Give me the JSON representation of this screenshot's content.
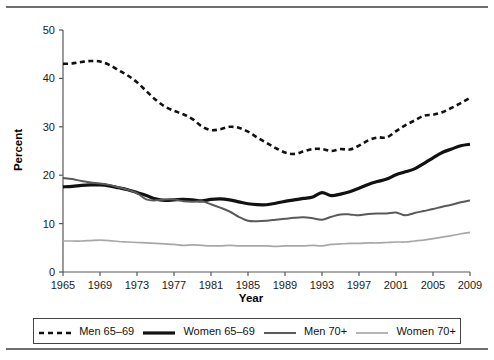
{
  "figure": {
    "has_top_rule": true,
    "has_bottom_rule": true,
    "rule_color": "#6e6e6e",
    "background": "#ffffff"
  },
  "axis": {
    "x_title": "Year",
    "y_title": "Percent",
    "x_ticks": [
      "1965",
      "1969",
      "1973",
      "1977",
      "1981",
      "1985",
      "1989",
      "1993",
      "1997",
      "2001",
      "2005",
      "2009"
    ],
    "y_ticks": [
      "0",
      "10",
      "20",
      "30",
      "40",
      "50"
    ]
  },
  "legend": {
    "items": [
      {
        "label": "Men 65–69",
        "style": "dashed",
        "color": "#111111",
        "width": 2.6
      },
      {
        "label": "Women 65–69",
        "style": "solid",
        "color": "#111111",
        "width": 3.2
      },
      {
        "label": "Men 70+",
        "style": "solid",
        "color": "#5a5a5a",
        "width": 2.0
      },
      {
        "label": "Women 70+",
        "style": "solid",
        "color": "#a8a8a8",
        "width": 1.7
      }
    ]
  },
  "chart_data": {
    "type": "line",
    "title": "",
    "subtitle": "",
    "xlabel": "Year",
    "ylabel": "Percent",
    "xlim": [
      1965,
      2009
    ],
    "ylim": [
      0,
      50
    ],
    "xticks": [
      1965,
      1969,
      1973,
      1977,
      1981,
      1985,
      1989,
      1993,
      1997,
      2001,
      2005,
      2009
    ],
    "yticks": [
      0,
      10,
      20,
      30,
      40,
      50
    ],
    "grid": false,
    "legend_position": "below-plot",
    "x": [
      1965,
      1966,
      1967,
      1968,
      1969,
      1970,
      1971,
      1972,
      1973,
      1974,
      1975,
      1976,
      1977,
      1978,
      1979,
      1980,
      1981,
      1982,
      1983,
      1984,
      1985,
      1986,
      1987,
      1988,
      1989,
      1990,
      1991,
      1992,
      1993,
      1994,
      1995,
      1996,
      1997,
      1998,
      1999,
      2000,
      2001,
      2002,
      2003,
      2004,
      2005,
      2006,
      2007,
      2008,
      2009
    ],
    "series": [
      {
        "name": "Men 65–69",
        "color": "#111111",
        "style": "dashed",
        "values": [
          43.0,
          43.1,
          43.4,
          43.6,
          43.5,
          42.8,
          41.7,
          40.6,
          39.2,
          37.4,
          35.6,
          34.2,
          33.3,
          32.6,
          31.6,
          30.1,
          29.3,
          29.5,
          30.0,
          29.8,
          29.0,
          27.8,
          26.7,
          25.6,
          24.7,
          24.4,
          24.9,
          25.4,
          25.4,
          25.0,
          25.4,
          25.3,
          26.1,
          27.2,
          27.8,
          27.8,
          29.1,
          30.3,
          31.3,
          32.3,
          32.5,
          33.0,
          33.9,
          34.9,
          36.0
        ]
      },
      {
        "name": "Women 65–69",
        "color": "#111111",
        "style": "solid",
        "values": [
          17.6,
          17.7,
          17.9,
          18.0,
          18.0,
          17.8,
          17.4,
          17.0,
          16.4,
          15.8,
          15.1,
          14.8,
          14.9,
          15.0,
          14.9,
          14.7,
          15.0,
          15.1,
          14.9,
          14.5,
          14.1,
          13.9,
          13.9,
          14.2,
          14.6,
          14.9,
          15.2,
          15.5,
          16.4,
          15.8,
          16.1,
          16.6,
          17.3,
          18.1,
          18.7,
          19.2,
          20.1,
          20.7,
          21.3,
          22.4,
          23.6,
          24.7,
          25.4,
          26.1,
          26.4
        ]
      },
      {
        "name": "Men 70+",
        "color": "#5a5a5a",
        "style": "solid",
        "values": [
          19.4,
          19.2,
          18.8,
          18.5,
          18.3,
          18.0,
          17.5,
          17.0,
          16.3,
          15.0,
          14.8,
          15.0,
          15.0,
          14.6,
          14.5,
          14.6,
          14.0,
          13.3,
          12.5,
          11.4,
          10.6,
          10.5,
          10.6,
          10.8,
          11.0,
          11.2,
          11.3,
          11.1,
          10.8,
          11.4,
          11.9,
          11.9,
          11.7,
          12.0,
          12.1,
          12.1,
          12.3,
          11.7,
          12.2,
          12.6,
          13.0,
          13.5,
          13.9,
          14.4,
          14.8
        ]
      },
      {
        "name": "Women 70+",
        "color": "#a8a8a8",
        "style": "solid",
        "values": [
          6.4,
          6.4,
          6.4,
          6.5,
          6.6,
          6.5,
          6.3,
          6.2,
          6.1,
          6.0,
          5.9,
          5.8,
          5.7,
          5.5,
          5.6,
          5.5,
          5.4,
          5.4,
          5.5,
          5.4,
          5.4,
          5.4,
          5.4,
          5.3,
          5.4,
          5.4,
          5.4,
          5.5,
          5.4,
          5.7,
          5.8,
          5.9,
          5.9,
          6.0,
          6.0,
          6.1,
          6.2,
          6.2,
          6.4,
          6.6,
          6.9,
          7.2,
          7.5,
          7.9,
          8.2
        ]
      }
    ]
  }
}
